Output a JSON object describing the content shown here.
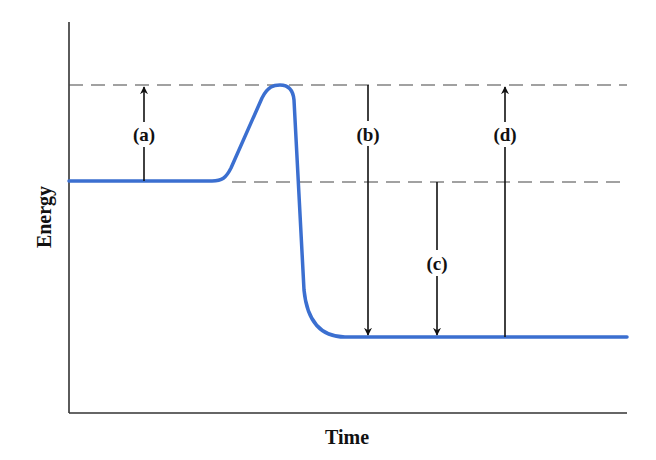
{
  "diagram": {
    "xlabel": "Time",
    "ylabel": "Energy",
    "colors": {
      "curve": "#3b6fd0",
      "axis": "#333333",
      "dashed": "#444444",
      "arrow": "#111111"
    },
    "levels": {
      "reactants": "initial energy level",
      "transition_state": "peak energy level",
      "products": "final energy level"
    },
    "arrows": [
      {
        "id": "a",
        "label": "(a)",
        "from": "reactants",
        "to": "transition_state",
        "direction": "up"
      },
      {
        "id": "b",
        "label": "(b)",
        "from": "transition_state",
        "to": "products",
        "direction": "down"
      },
      {
        "id": "c",
        "label": "(c)",
        "from": "reactants",
        "to": "products",
        "direction": "down"
      },
      {
        "id": "d",
        "label": "(d)",
        "from": "products",
        "to": "transition_state",
        "direction": "up"
      }
    ]
  }
}
